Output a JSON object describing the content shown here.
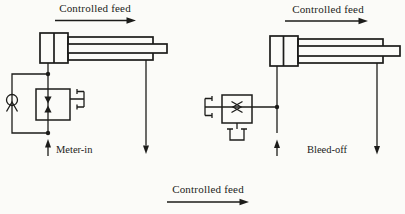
{
  "page": {
    "background": "#fbfbf8",
    "ink": "#1c1c1a"
  },
  "circuits": {
    "meter_in": {
      "feed_label": "Controlled feed",
      "name": "Meter-in"
    },
    "bleed_off": {
      "feed_label": "Controlled feed",
      "name": "Bleed-off"
    }
  },
  "footer": {
    "feed_label": "Controlled feed"
  }
}
